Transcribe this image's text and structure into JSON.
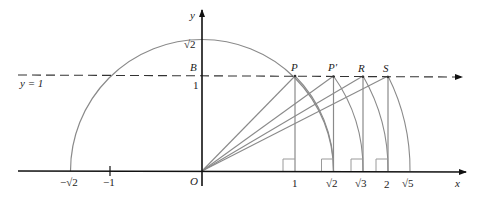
{
  "diagram": {
    "axes": {
      "x_label": "x",
      "y_label": "y",
      "origin_label": "O"
    },
    "line": {
      "label": "y = 1",
      "style": "dashed"
    },
    "y_ticks": [
      {
        "label": "√2",
        "value": 1.41421
      },
      {
        "label": "1",
        "value": 1
      }
    ],
    "y_point_label": "B",
    "x_ticks": [
      {
        "label": "−√2",
        "value": -1.41421
      },
      {
        "label": "−1",
        "value": -1
      },
      {
        "label": "1",
        "value": 1
      },
      {
        "label": "√2",
        "value": 1.41421
      },
      {
        "label": "√3",
        "value": 1.73205
      },
      {
        "label": "2",
        "value": 2
      },
      {
        "label": "√5",
        "value": 2.23607
      }
    ],
    "points": [
      {
        "label": "P",
        "x": 1,
        "y": 1
      },
      {
        "label": "P′",
        "x": 1.41421,
        "y": 1
      },
      {
        "label": "R",
        "x": 1.73205,
        "y": 1
      },
      {
        "label": "S",
        "x": 2,
        "y": 1
      }
    ],
    "semicircle": {
      "radius_label": "√2",
      "center": "O"
    },
    "colors": {
      "axis": "#1a1a1a",
      "construction": "#8a8a8a",
      "text": "#222222"
    }
  }
}
